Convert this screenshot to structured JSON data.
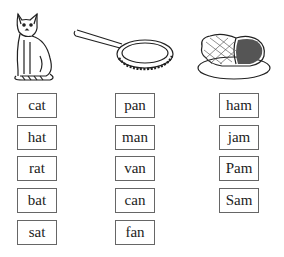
{
  "pictures": [
    {
      "name": "cat",
      "icon": "cat-icon"
    },
    {
      "name": "frying pan",
      "icon": "frying-pan-icon"
    },
    {
      "name": "ham",
      "icon": "ham-icon"
    }
  ],
  "columns": [
    {
      "family": "-at",
      "words": [
        "cat",
        "hat",
        "rat",
        "bat",
        "sat"
      ]
    },
    {
      "family": "-an",
      "words": [
        "pan",
        "man",
        "van",
        "can",
        "fan"
      ]
    },
    {
      "family": "-am",
      "words": [
        "ham",
        "jam",
        "Pam",
        "Sam"
      ]
    }
  ]
}
